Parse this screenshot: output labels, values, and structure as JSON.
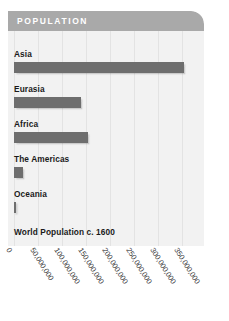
{
  "panel": {
    "header_title": "POPULATION",
    "caption": "World Population c. 1600"
  },
  "chart_data": {
    "type": "bar",
    "orientation": "horizontal",
    "title": "POPULATION",
    "subtitle": "World Population c. 1600",
    "xlabel": "",
    "ylabel": "",
    "categories": [
      "Asia",
      "Eurasia",
      "Africa",
      "The Americas",
      "Oceania"
    ],
    "values": [
      355000000,
      140000000,
      155000000,
      18000000,
      3000000
    ],
    "series": [
      {
        "name": "World Population c. 1600",
        "values": [
          355000000,
          140000000,
          155000000,
          18000000,
          3000000
        ]
      }
    ],
    "xlim": [
      0,
      350000000
    ],
    "xticks": [
      0,
      50000000,
      100000000,
      150000000,
      200000000,
      250000000,
      300000000,
      350000000
    ],
    "xticklabels": [
      "0",
      "50,000,000",
      "100,000,000",
      "150,000,000",
      "200,000,000",
      "250,000,000",
      "300,000,000",
      "350,000,000"
    ],
    "grid": true,
    "grid_axis": "x",
    "legend": false,
    "bar_color": "#6e6e6e",
    "header_color": "#a9a9a9",
    "panel_color": "#f2f2f2",
    "gridline_color": "#e3e3e3",
    "label_color": "#1a1a1a"
  }
}
